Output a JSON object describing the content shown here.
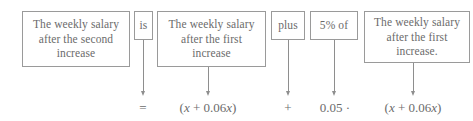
{
  "diagram": {
    "text_color": "#6b6b6b",
    "border_color": "#9a9a9a",
    "arrow_color": "#8e8e8e",
    "background": "#ffffff",
    "boxes": [
      {
        "id": "phrase-1",
        "text": "The weekly salary after the second increase"
      },
      {
        "id": "operator-is",
        "text": "is"
      },
      {
        "id": "phrase-2",
        "text": "The weekly salary after the first increase"
      },
      {
        "id": "operator-plus",
        "text": "plus"
      },
      {
        "id": "operator-percent",
        "text": "5% of"
      },
      {
        "id": "phrase-3",
        "text": "The weekly salary after the first increase."
      }
    ],
    "equation": {
      "equals": "=",
      "term_left": "(x + 0.06x)",
      "plus": "+",
      "coefficient": "0.05 ·",
      "term_right": "(x + 0.06x)",
      "full": "= (x + 0.06x) + 0.05 · (x + 0.06x)"
    }
  }
}
